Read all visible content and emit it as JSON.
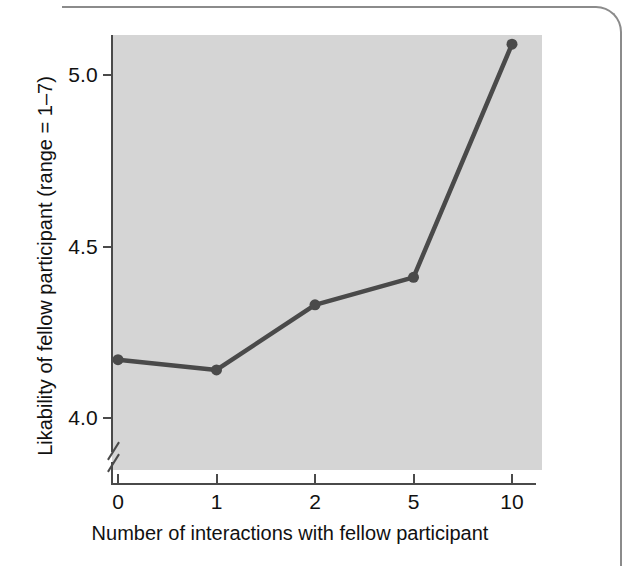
{
  "figure": {
    "y_axis_title": "Likability of fellow participant (range = 1–7)",
    "x_axis_title": "Number of interactions with fellow participant",
    "line_color": "#4a4a4a",
    "plot_background": "#d5d5d5",
    "axis_color": "#4a4a4a",
    "axis_break_symbol": "axis-break-slashes"
  },
  "chart_data": {
    "type": "line",
    "title": "",
    "xlabel": "Number of interactions with fellow participant",
    "ylabel": "Likability of fellow participant (range = 1–7)",
    "categories": [
      "0",
      "1",
      "2",
      "5",
      "10"
    ],
    "x_tick_labels": [
      "0",
      "1",
      "2",
      "5",
      "10"
    ],
    "y_tick_labels": [
      "4.0",
      "4.5",
      "5.0"
    ],
    "y_ticks": [
      4.0,
      4.5,
      5.0
    ],
    "ylim": [
      3.9,
      5.17
    ],
    "axis_break": true,
    "axis_break_below": 4.0,
    "grid": false,
    "legend": "none",
    "series": [
      {
        "name": "Likability",
        "values": [
          4.17,
          4.14,
          4.33,
          4.41,
          5.09
        ],
        "marker": "circle",
        "color": "#4a4a4a"
      }
    ]
  }
}
